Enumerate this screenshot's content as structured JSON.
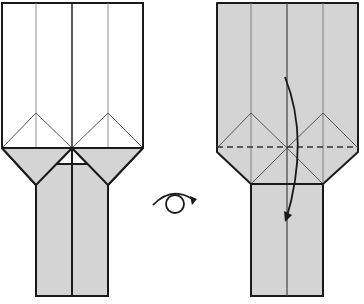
{
  "diagram": {
    "colors": {
      "paper_front": "#ffffff",
      "paper_back": "#d4d4d4",
      "outline": "#1a1a1a",
      "crease": "#6a6a6a"
    },
    "steps": [
      {
        "id": "before",
        "description": "Model with white front, two kite-shaped bottom flaps folded down (colored side showing), two narrow legs below"
      },
      {
        "id": "after",
        "description": "Model turned over (colored side up); valley-fold the top section down along the dashed line"
      }
    ],
    "symbols": [
      {
        "type": "turn-over",
        "label": "Turn the model over"
      },
      {
        "type": "valley-fold-line",
        "label": "Valley fold (dashed line)"
      },
      {
        "type": "fold-arrow",
        "label": "Fold top down"
      }
    ]
  }
}
